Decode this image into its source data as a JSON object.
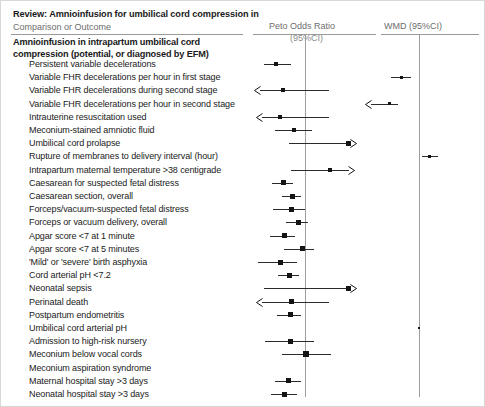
{
  "header": {
    "review_title": "Review: Amnioinfusion for umbilical cord compression in",
    "col_outcome": "Comparison or Outcome",
    "col_peto": "Peto Odds Ratio",
    "col_peto_sub": "(95%CI)",
    "col_wmd": "WMD (95%CI)"
  },
  "comparison": {
    "heading": "Amnioinfusion in intrapartum umbilical cord compression (potential, or diagnosed by EFM)"
  },
  "chart_data": {
    "type": "forest",
    "title": "Review: Amnioinfusion for umbilical cord compression in",
    "subtitle": "Amnioinfusion in intrapartum umbilical cord compression (potential, or diagnosed by EFM)",
    "columns": [
      "Comparison or Outcome",
      "Peto Odds Ratio (95%CI)",
      "WMD (95%CI)"
    ],
    "peto_null": 1,
    "wmd_null": 0,
    "grid": false,
    "legend": "none",
    "rows": [
      {
        "label": "Persistent variable decelerations",
        "peto": {
          "center": 275,
          "lo": 263,
          "hi": 290,
          "box": 4,
          "arrow_left": false,
          "arrow_right": false
        },
        "wmd": null
      },
      {
        "label": "Variable FHR decelerations per hour in first stage",
        "peto": null,
        "wmd": {
          "center": 400,
          "lo": 390,
          "hi": 410,
          "box": 3,
          "arrow_left": false,
          "arrow_right": false
        }
      },
      {
        "label": "Variable FHR decelerations during second stage",
        "peto": {
          "center": 282,
          "lo": 259,
          "hi": 328,
          "box": 4,
          "arrow_left": true,
          "arrow_right": false
        },
        "wmd": null
      },
      {
        "label": "Variable FHR decelerations per hour in second stage",
        "peto": null,
        "wmd": {
          "center": 388,
          "lo": 370,
          "hi": 397,
          "box": 3,
          "arrow_left": true,
          "arrow_right": false
        }
      },
      {
        "label": "Intrauterine resuscitation used",
        "peto": {
          "center": 279,
          "lo": 261,
          "hi": 328,
          "box": 4,
          "arrow_left": true,
          "arrow_right": false
        },
        "wmd": null
      },
      {
        "label": "Meconium-stained amniotic fluid",
        "peto": {
          "center": 293,
          "lo": 274,
          "hi": 311,
          "box": 4,
          "arrow_left": false,
          "arrow_right": false
        },
        "wmd": null
      },
      {
        "label": "Umbilical cord prolapse",
        "peto": {
          "center": 347,
          "lo": 288,
          "hi": 350,
          "box": 5,
          "arrow_left": false,
          "arrow_right": true
        },
        "wmd": null
      },
      {
        "label": "Rupture of membranes to delivery interval (hour)",
        "peto": null,
        "wmd": {
          "center": 428,
          "lo": 421,
          "hi": 437,
          "box": 3,
          "arrow_left": false,
          "arrow_right": false
        }
      },
      {
        "label": "Intrapartum maternal temperature >38 centigrade",
        "peto": {
          "center": 329,
          "lo": 290,
          "hi": 348,
          "box": 4,
          "arrow_left": false,
          "arrow_right": true
        },
        "wmd": null
      },
      {
        "label": "Caesarean for suspected fetal distress",
        "peto": {
          "center": 282,
          "lo": 271,
          "hi": 292,
          "box": 5,
          "arrow_left": false,
          "arrow_right": false
        },
        "wmd": null
      },
      {
        "label": "Caesarean section, overall",
        "peto": {
          "center": 291,
          "lo": 281,
          "hi": 300,
          "box": 5,
          "arrow_left": false,
          "arrow_right": false
        },
        "wmd": null
      },
      {
        "label": "Forceps/vacuum-suspected fetal distress",
        "peto": {
          "center": 290,
          "lo": 272,
          "hi": 304,
          "box": 5,
          "arrow_left": false,
          "arrow_right": false
        },
        "wmd": null
      },
      {
        "label": "Forceps or vacuum delivery, overall",
        "peto": {
          "center": 297,
          "lo": 285,
          "hi": 307,
          "box": 5,
          "arrow_left": false,
          "arrow_right": false
        },
        "wmd": null
      },
      {
        "label": "Apgar score <7 at 1 minute",
        "peto": {
          "center": 283,
          "lo": 269,
          "hi": 294,
          "box": 5,
          "arrow_left": false,
          "arrow_right": false
        },
        "wmd": null
      },
      {
        "label": "Apgar score <7 at 5 minutes",
        "peto": {
          "center": 301,
          "lo": 283,
          "hi": 313,
          "box": 5,
          "arrow_left": false,
          "arrow_right": false
        },
        "wmd": null
      },
      {
        "label": "'Mild' or 'severe' birth asphyxia",
        "peto": {
          "center": 279,
          "lo": 257,
          "hi": 296,
          "box": 5,
          "arrow_left": false,
          "arrow_right": false
        },
        "wmd": null
      },
      {
        "label": "Cord arterial pH <7.2",
        "peto": {
          "center": 288,
          "lo": 277,
          "hi": 298,
          "box": 5,
          "arrow_left": false,
          "arrow_right": false
        },
        "wmd": null
      },
      {
        "label": "Neonatal sepsis",
        "peto": {
          "center": 347,
          "lo": 263,
          "hi": 350,
          "box": 5,
          "arrow_left": false,
          "arrow_right": true
        },
        "wmd": null
      },
      {
        "label": "Perinatal death",
        "peto": {
          "center": 290,
          "lo": 261,
          "hi": 328,
          "box": 5,
          "arrow_left": true,
          "arrow_right": false
        },
        "wmd": null
      },
      {
        "label": "Postpartum endometritis",
        "peto": {
          "center": 289,
          "lo": 276,
          "hi": 300,
          "box": 5,
          "arrow_left": false,
          "arrow_right": false
        },
        "wmd": null
      },
      {
        "label": "Umbilical cord arterial pH",
        "peto": null,
        "wmd": {
          "center": 418,
          "lo": 417,
          "hi": 419,
          "box": 2,
          "arrow_left": false,
          "arrow_right": false
        }
      },
      {
        "label": "Admission to high-risk nursery",
        "peto": {
          "center": 289,
          "lo": 264,
          "hi": 313,
          "box": 5,
          "arrow_left": false,
          "arrow_right": false
        },
        "wmd": null
      },
      {
        "label": "Meconium below vocal cords",
        "peto": {
          "center": 305,
          "lo": 281,
          "hi": 330,
          "box": 6,
          "arrow_left": false,
          "arrow_right": false
        },
        "wmd": null
      },
      {
        "label": "Meconium aspiration syndrome",
        "peto": null,
        "wmd": null
      },
      {
        "label": "Maternal hospital stay >3 days",
        "peto": {
          "center": 287,
          "lo": 274,
          "hi": 300,
          "box": 5,
          "arrow_left": false,
          "arrow_right": false
        },
        "wmd": null
      },
      {
        "label": "Neonatal hospital stay >3 days",
        "peto": {
          "center": 283,
          "lo": 270,
          "hi": 296,
          "box": 5,
          "arrow_left": false,
          "arrow_right": false
        },
        "wmd": null
      }
    ],
    "row_top_start": 57,
    "row_height": 13.2
  },
  "colors": {
    "marker": "#141414",
    "line": "#2b2b2b",
    "rule": "#9a9a9a",
    "null_line": "#9e9e9e",
    "header_text": "#6d6d6d",
    "body_text": "#1a1a1a"
  }
}
